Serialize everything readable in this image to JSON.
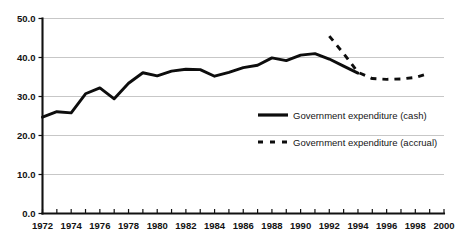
{
  "chart_data": {
    "type": "line",
    "title": "",
    "subtitle": "",
    "xlabel": "",
    "ylabel": "",
    "xlim": [
      1972,
      2000
    ],
    "ylim": [
      0.0,
      50.0
    ],
    "grid": true,
    "legend_position": "center-right-inside",
    "y_ticks": [
      "0.0",
      "10.0",
      "20.0",
      "30.0",
      "40.0",
      "50.0"
    ],
    "y_tick_values": [
      0.0,
      10.0,
      20.0,
      30.0,
      40.0,
      50.0
    ],
    "x_ticks": [
      "1972",
      "1974",
      "1976",
      "1978",
      "1980",
      "1982",
      "1984",
      "1986",
      "1988",
      "1990",
      "1992",
      "1994",
      "1996",
      "1998",
      "2000"
    ],
    "x_tick_values": [
      1972,
      1974,
      1976,
      1978,
      1980,
      1982,
      1984,
      1986,
      1988,
      1990,
      1992,
      1994,
      1996,
      1998,
      2000
    ],
    "x_minor_tick_values": [
      1972,
      1973,
      1974,
      1975,
      1976,
      1977,
      1978,
      1979,
      1980,
      1981,
      1982,
      1983,
      1984,
      1985,
      1986,
      1987,
      1988,
      1989,
      1990,
      1991,
      1992,
      1993,
      1994,
      1995,
      1996,
      1997,
      1998,
      1999,
      2000
    ],
    "series": [
      {
        "name": "Government expenditure (cash)",
        "style": "solid",
        "color": "#0d0d0d",
        "x": [
          1972,
          1973,
          1974,
          1975,
          1976,
          1977,
          1978,
          1979,
          1980,
          1981,
          1982,
          1983,
          1984,
          1985,
          1986,
          1987,
          1988,
          1989,
          1990,
          1991,
          1992,
          1993,
          1994
        ],
        "values": [
          24.7,
          26.1,
          25.8,
          30.7,
          32.2,
          29.4,
          33.4,
          36.1,
          35.3,
          36.5,
          37.0,
          36.9,
          35.2,
          36.2,
          37.4,
          38.0,
          39.9,
          39.2,
          40.6,
          41.0,
          39.6,
          37.8,
          36.0
        ]
      },
      {
        "name": "Government expenditure (accrual)",
        "style": "dashed",
        "color": "#0d0d0d",
        "x": [
          1992,
          1993,
          1994,
          1995,
          1996,
          1997,
          1998,
          1999
        ],
        "values": [
          45.5,
          41.0,
          36.2,
          34.6,
          34.4,
          34.5,
          34.9,
          36.0
        ]
      }
    ],
    "legend": [
      {
        "label": "Government expenditure (cash)",
        "style": "solid"
      },
      {
        "label": "Government expenditure (accrual)",
        "style": "dashed"
      }
    ]
  }
}
